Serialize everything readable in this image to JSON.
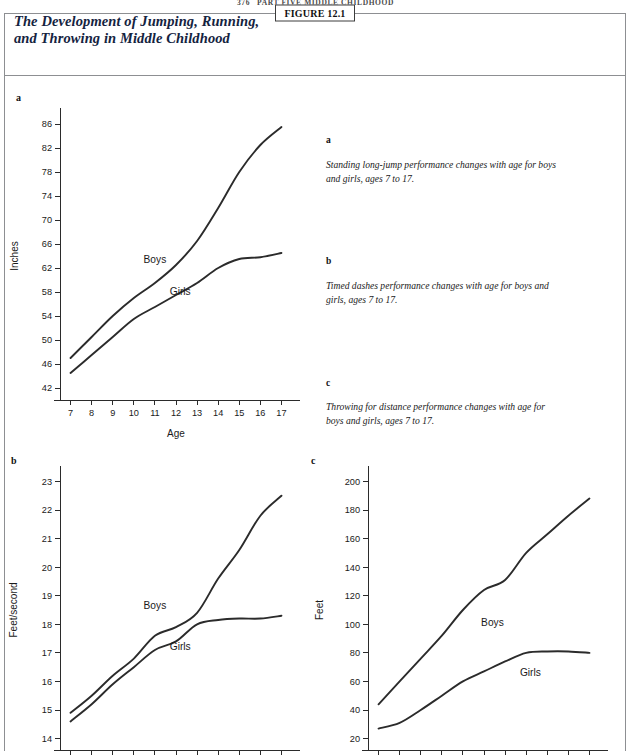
{
  "running_head": {
    "page_number": "376",
    "text": "PART FIVE   MIDDLE CHILDHOOD"
  },
  "figure": {
    "tag": "FIGURE 12.1",
    "title": "The Development of Jumping, Running,\nand Throwing in Middle Childhood"
  },
  "panels": {
    "a": {
      "letter": "a"
    },
    "b": {
      "letter": "b"
    },
    "c": {
      "letter": "c"
    }
  },
  "captions": [
    {
      "letter": "a",
      "text": "Standing long-jump performance changes with age for boys and girls, ages 7 to 17."
    },
    {
      "letter": "b",
      "text": "Timed dashes performance changes with age for boys and girls, ages 7 to 17."
    },
    {
      "letter": "c",
      "text": "Throwing for distance performance changes with age for boys and girls, ages 7 to 17."
    }
  ],
  "chart_data": [
    {
      "id": "a",
      "type": "line",
      "title": "",
      "xlabel": "Age",
      "ylabel": "Inches",
      "x": [
        7,
        8,
        9,
        10,
        11,
        12,
        13,
        14,
        15,
        16,
        17
      ],
      "xticklabels": [
        "7",
        "8",
        "9",
        "10",
        "11",
        "12",
        "13",
        "14",
        "15",
        "16",
        "17"
      ],
      "xlim": [
        6.5,
        17.5
      ],
      "ylim": [
        40,
        88
      ],
      "yticks": [
        42,
        46,
        50,
        54,
        58,
        62,
        66,
        70,
        74,
        78,
        82,
        86
      ],
      "yticklabels": [
        "42",
        "46",
        "50",
        "54",
        "58",
        "62",
        "66",
        "70",
        "74",
        "78",
        "82",
        "86"
      ],
      "grid": false,
      "legend_position": "inline",
      "series": [
        {
          "name": "Boys",
          "values": [
            47.0,
            50.5,
            54.0,
            57.0,
            59.5,
            62.5,
            66.5,
            72.0,
            78.0,
            82.5,
            85.5
          ],
          "label_x": 11.0,
          "label_y": 62.8
        },
        {
          "name": "Girls",
          "values": [
            44.5,
            47.5,
            50.5,
            53.5,
            55.5,
            57.5,
            59.5,
            62.0,
            63.5,
            63.8,
            64.5
          ],
          "label_x": 12.2,
          "label_y": 57.5
        }
      ]
    },
    {
      "id": "b",
      "type": "line",
      "title": "",
      "xlabel": "",
      "ylabel": "Feet/second",
      "x": [
        7,
        8,
        9,
        10,
        11,
        12,
        13,
        14,
        15,
        16,
        17
      ],
      "xticklabels": [
        "7",
        "8",
        "9",
        "10",
        "11",
        "12",
        "13",
        "14",
        "15",
        "16",
        "17"
      ],
      "xlim": [
        6.5,
        17.5
      ],
      "ylim": [
        13.6,
        23.4
      ],
      "yticks": [
        14,
        15,
        16,
        17,
        18,
        19,
        20,
        21,
        22,
        23
      ],
      "yticklabels": [
        "14",
        "15",
        "16",
        "17",
        "18",
        "19",
        "20",
        "21",
        "22",
        "23"
      ],
      "grid": false,
      "legend_position": "inline",
      "series": [
        {
          "name": "Boys",
          "values": [
            14.9,
            15.5,
            16.2,
            16.8,
            17.6,
            17.9,
            18.4,
            19.6,
            20.6,
            21.8,
            22.5
          ],
          "label_x": 11.0,
          "label_y": 18.55
        },
        {
          "name": "Girls",
          "values": [
            14.6,
            15.2,
            15.9,
            16.5,
            17.1,
            17.4,
            18.0,
            18.15,
            18.2,
            18.2,
            18.3
          ],
          "label_x": 12.2,
          "label_y": 17.1
        }
      ]
    },
    {
      "id": "c",
      "type": "line",
      "title": "",
      "xlabel": "",
      "ylabel": "Feet",
      "x": [
        7,
        8,
        9,
        10,
        11,
        12,
        13,
        14,
        15,
        16,
        17
      ],
      "xticklabels": [
        "7",
        "8",
        "9",
        "10",
        "11",
        "12",
        "13",
        "14",
        "15",
        "16",
        "17"
      ],
      "xlim": [
        6.5,
        17.5
      ],
      "ylim": [
        12,
        208
      ],
      "yticks": [
        20,
        40,
        60,
        80,
        100,
        120,
        140,
        160,
        180,
        200
      ],
      "yticklabels": [
        "20",
        "40",
        "60",
        "80",
        "100",
        "120",
        "140",
        "160",
        "180",
        "200"
      ],
      "grid": false,
      "legend_position": "inline",
      "series": [
        {
          "name": "Boys",
          "values": [
            44,
            60,
            76,
            92,
            110,
            124,
            131,
            150,
            163,
            176,
            188
          ],
          "label_x": 12.4,
          "label_y": 99
        },
        {
          "name": "Girls",
          "values": [
            27,
            31,
            40,
            50,
            60,
            67,
            74,
            80,
            81,
            81,
            80
          ],
          "label_x": 14.2,
          "label_y": 64
        }
      ]
    }
  ]
}
